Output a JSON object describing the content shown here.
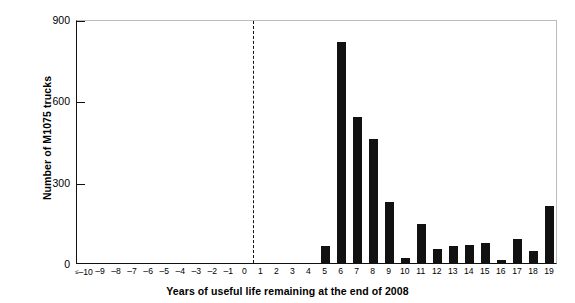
{
  "chart_data": {
    "type": "bar",
    "title": "",
    "xlabel": "Years of useful life remaining at the end of 2008",
    "ylabel": "Number of M1075 trucks",
    "categories": [
      "≤ –10",
      "–9",
      "–8",
      "–7",
      "–6",
      "–5",
      "–4",
      "–3",
      "–2",
      "–1",
      "0",
      "1",
      "2",
      "3",
      "4",
      "5",
      "6",
      "7",
      "8",
      "9",
      "10",
      "11",
      "12",
      "13",
      "14",
      "15",
      "16",
      "17",
      "18",
      "19"
    ],
    "values": [
      0,
      0,
      0,
      0,
      0,
      0,
      0,
      0,
      0,
      0,
      0,
      0,
      0,
      0,
      0,
      62,
      815,
      538,
      457,
      225,
      18,
      144,
      52,
      63,
      66,
      74,
      11,
      89,
      44,
      210
    ],
    "ylim": [
      0,
      900
    ],
    "yticks": [
      0,
      300,
      600,
      900
    ],
    "ytick_labels": [
      "0",
      "300",
      "600",
      "900"
    ],
    "grid": false,
    "legend": null,
    "bar_color": "#111111",
    "annotations": [
      {
        "name": "present-day-divider",
        "type": "vertical-dashed-line",
        "x_value": 0.5,
        "label": ""
      }
    ]
  },
  "axis": {
    "y_title": "Number of M1075 trucks",
    "x_title": "Years of useful life remaining at the end of 2008"
  }
}
